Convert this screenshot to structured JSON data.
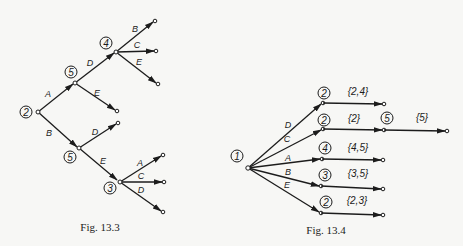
{
  "figures": [
    {
      "id": "fig-13-3",
      "caption": "Fig. 13.3",
      "root": {
        "value": "2"
      },
      "nodes": [
        {
          "key": "n2",
          "value": "2"
        },
        {
          "key": "n5a",
          "value": "5"
        },
        {
          "key": "n4",
          "value": "4"
        },
        {
          "key": "n5b",
          "value": "5"
        },
        {
          "key": "n3",
          "value": "3"
        }
      ],
      "edges": [
        {
          "from": "n2",
          "to": "n5a",
          "label": "A"
        },
        {
          "from": "n2",
          "to": "n5b",
          "label": "B"
        },
        {
          "from": "n5a",
          "to": "n4",
          "label": "D"
        },
        {
          "from": "n5a",
          "to": "leaf",
          "label": "E"
        },
        {
          "from": "n4",
          "to": "leaf",
          "label": "B"
        },
        {
          "from": "n4",
          "to": "leaf",
          "label": "C"
        },
        {
          "from": "n4",
          "to": "leaf",
          "label": "E"
        },
        {
          "from": "n5b",
          "to": "leaf",
          "label": "D"
        },
        {
          "from": "n5b",
          "to": "n3",
          "label": "E"
        },
        {
          "from": "n3",
          "to": "leaf",
          "label": "A"
        },
        {
          "from": "n3",
          "to": "leaf",
          "label": "C"
        },
        {
          "from": "n3",
          "to": "leaf",
          "label": "D"
        }
      ]
    },
    {
      "id": "fig-13-4",
      "caption": "Fig. 13.4",
      "root": {
        "value": "1"
      },
      "branches": [
        {
          "label": "D",
          "node": "2",
          "set": "{2,4}"
        },
        {
          "label": "C",
          "node": "2",
          "set": "{2}",
          "next_node": "5",
          "next_set": "{5}"
        },
        {
          "label": "A",
          "node": "4",
          "set": "{4,5}"
        },
        {
          "label": "B",
          "node": "3",
          "set": "{3,5}"
        },
        {
          "label": "E",
          "node": "2",
          "set": "{2,3}"
        }
      ]
    }
  ]
}
